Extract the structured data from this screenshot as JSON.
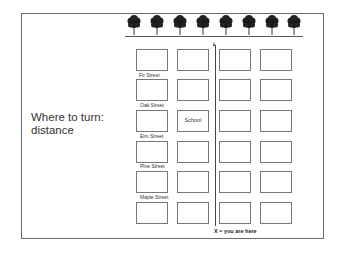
{
  "slide": {
    "title_line1": "Where to turn:",
    "title_line2": "distance",
    "title": "Where to turn:\ndistance"
  },
  "map": {
    "trees": [
      {
        "icon": "tree-icon",
        "x": 127
      },
      {
        "icon": "tree-icon",
        "x": 150
      },
      {
        "icon": "tree-icon",
        "x": 173
      },
      {
        "icon": "tree-icon",
        "x": 196
      },
      {
        "icon": "tree-icon",
        "x": 219
      },
      {
        "icon": "tree-icon",
        "x": 242
      },
      {
        "icon": "tree-icon",
        "x": 265
      },
      {
        "icon": "tree-icon",
        "x": 287
      }
    ],
    "streets": [
      "Fir Street",
      "Oak Street",
      "Elm Street",
      "Pine Street",
      "Maple Street"
    ],
    "landmark": {
      "label": "School",
      "row": 3,
      "col": 2
    },
    "legend": "X = you are here",
    "grid": {
      "rows": 6,
      "cols": 4
    }
  }
}
